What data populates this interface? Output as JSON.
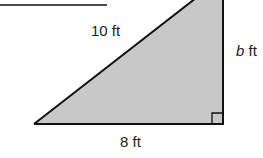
{
  "figure": {
    "type": "right-triangle",
    "fill_color": "#c8c8c8",
    "stroke_color": "#111111",
    "labels": {
      "hypotenuse": "10 ft",
      "base": "8 ft",
      "height_var": "b",
      "height_unit": " ft"
    },
    "right_angle_marker": true
  }
}
